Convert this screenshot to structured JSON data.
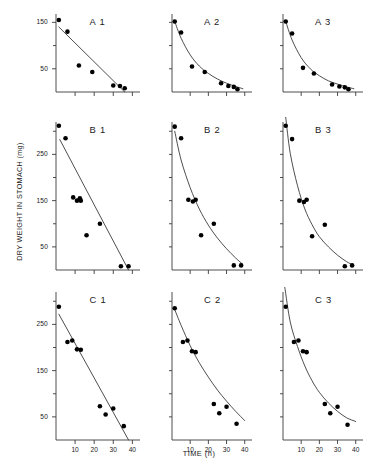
{
  "figure": {
    "ylabel": "DRY WEIGHT IN STOMACH (mg)",
    "xlabel": "TIME (h)",
    "line_color": "#3a3a3a",
    "point_color": "#000000",
    "axis_color": "#3a3a3a",
    "background": "#ffffff"
  },
  "chart_data": {
    "type": "scatter",
    "title": "",
    "xlabel": "TIME (h)",
    "ylabel": "DRY WEIGHT IN STOMACH (mg)",
    "grid": false,
    "legend": "none",
    "layout": {
      "rows": 3,
      "cols": 3
    },
    "panels": [
      {
        "label": "A 1",
        "row": 0,
        "col": 0,
        "xlim": [
          0,
          44
        ],
        "ylim": [
          0,
          168
        ],
        "yticks": [
          50,
          100,
          150
        ],
        "yticklabels": [
          "50",
          "",
          "150"
        ],
        "xticks": [
          10,
          20,
          30,
          40
        ],
        "xticklabels": [
          "",
          "",
          "",
          ""
        ],
        "fit": "linear",
        "fit_points": [
          [
            1.5,
            140
          ],
          [
            36,
            0
          ]
        ],
        "x": [
          1.5,
          6,
          12,
          19,
          30,
          33.5,
          36
        ],
        "y": [
          155,
          130,
          57,
          43,
          14,
          13,
          8
        ]
      },
      {
        "label": "A 2",
        "row": 0,
        "col": 1,
        "xlim": [
          0,
          44
        ],
        "ylim": [
          0,
          168
        ],
        "yticks": [
          50,
          100,
          150
        ],
        "yticklabels": [
          "",
          "",
          ""
        ],
        "xticks": [
          10,
          20,
          30,
          40
        ],
        "xticklabels": [
          "",
          "",
          "",
          ""
        ],
        "fit": "exponential",
        "fit_points": [
          [
            1.5,
            152
          ],
          [
            5,
            116
          ],
          [
            10,
            80
          ],
          [
            15,
            56
          ],
          [
            20,
            40
          ],
          [
            25,
            28
          ],
          [
            30,
            19
          ],
          [
            35,
            12
          ],
          [
            39,
            7
          ]
        ],
        "x": [
          1.5,
          5,
          11,
          18,
          27,
          31,
          34,
          36
        ],
        "y": [
          152,
          128,
          55,
          43,
          19,
          13,
          11,
          6
        ]
      },
      {
        "label": "A 3",
        "row": 0,
        "col": 2,
        "xlim": [
          0,
          44
        ],
        "ylim": [
          0,
          168
        ],
        "yticks": [
          50,
          100,
          150
        ],
        "yticklabels": [
          "",
          "",
          ""
        ],
        "xticks": [
          10,
          20,
          30,
          40
        ],
        "xticklabels": [
          "",
          "",
          "",
          ""
        ],
        "fit": "exponential",
        "fit_points": [
          [
            1.5,
            152
          ],
          [
            5,
            112
          ],
          [
            10,
            74
          ],
          [
            15,
            50
          ],
          [
            20,
            35
          ],
          [
            25,
            24
          ],
          [
            30,
            17
          ],
          [
            35,
            11
          ],
          [
            39,
            7
          ]
        ],
        "x": [
          1.5,
          5,
          11,
          17,
          27,
          31,
          34,
          36
        ],
        "y": [
          152,
          126,
          52,
          40,
          16,
          12,
          10,
          6
        ]
      },
      {
        "label": "B 1",
        "row": 1,
        "col": 0,
        "xlim": [
          0,
          44
        ],
        "ylim": [
          0,
          320
        ],
        "yticks": [
          50,
          100,
          150,
          200,
          250,
          300
        ],
        "yticklabels": [
          "50",
          "",
          "150",
          "",
          "250",
          ""
        ],
        "xticks": [
          10,
          20,
          30,
          40
        ],
        "xticklabels": [
          "",
          "",
          "",
          ""
        ],
        "fit": "linear",
        "fit_points": [
          [
            2,
            282
          ],
          [
            38,
            0
          ]
        ],
        "x": [
          1.5,
          5,
          9,
          11,
          12.5,
          13,
          16,
          23,
          34,
          38
        ],
        "y": [
          312,
          285,
          157,
          150,
          155,
          150,
          75,
          100,
          8,
          8
        ]
      },
      {
        "label": "B 2",
        "row": 1,
        "col": 1,
        "xlim": [
          0,
          44
        ],
        "ylim": [
          0,
          320
        ],
        "yticks": [
          50,
          100,
          150,
          200,
          250,
          300
        ],
        "yticklabels": [
          "",
          "",
          "",
          "",
          "",
          ""
        ],
        "xticks": [
          10,
          20,
          30,
          40
        ],
        "xticklabels": [
          "",
          "",
          "",
          ""
        ],
        "fit": "exponential",
        "fit_points": [
          [
            1.5,
            300
          ],
          [
            5,
            238
          ],
          [
            10,
            178
          ],
          [
            15,
            132
          ],
          [
            20,
            97
          ],
          [
            25,
            69
          ],
          [
            30,
            46
          ],
          [
            35,
            26
          ],
          [
            39,
            12
          ]
        ],
        "x": [
          1.5,
          5,
          9,
          11.5,
          13,
          16,
          23,
          34,
          38
        ],
        "y": [
          310,
          285,
          152,
          148,
          152,
          75,
          100,
          10,
          10
        ]
      },
      {
        "label": "B 3",
        "row": 1,
        "col": 2,
        "xlim": [
          0,
          44
        ],
        "ylim": [
          0,
          320
        ],
        "yticks": [
          50,
          100,
          150,
          200,
          250,
          300
        ],
        "yticklabels": [
          "",
          "",
          "",
          "",
          "",
          ""
        ],
        "xticks": [
          10,
          20,
          30,
          40
        ],
        "xticklabels": [
          "",
          "",
          "",
          ""
        ],
        "fit": "exponential",
        "fit_points": [
          [
            1.5,
            330
          ],
          [
            4,
            252
          ],
          [
            8,
            182
          ],
          [
            12,
            132
          ],
          [
            16,
            98
          ],
          [
            20,
            72
          ],
          [
            25,
            50
          ],
          [
            30,
            32
          ],
          [
            35,
            18
          ],
          [
            39,
            10
          ]
        ],
        "x": [
          1.5,
          5,
          9,
          11.5,
          13,
          16,
          23,
          34,
          38
        ],
        "y": [
          312,
          283,
          150,
          147,
          152,
          73,
          98,
          8,
          10
        ]
      },
      {
        "label": "C 1",
        "row": 2,
        "col": 0,
        "xlim": [
          0,
          44
        ],
        "ylim": [
          0,
          320
        ],
        "yticks": [
          50,
          100,
          150,
          200,
          250,
          300
        ],
        "yticklabels": [
          "50",
          "",
          "150",
          "",
          "250",
          ""
        ],
        "xticks": [
          10,
          20,
          30,
          40
        ],
        "xticklabels": [
          "10",
          "20",
          "30",
          "40"
        ],
        "fit": "linear",
        "fit_points": [
          [
            1.5,
            272
          ],
          [
            38,
            0
          ]
        ],
        "x": [
          1.5,
          6,
          8.5,
          11,
          13,
          23,
          26,
          30,
          35.5
        ],
        "y": [
          288,
          212,
          215,
          196,
          195,
          73,
          55,
          68,
          30
        ]
      },
      {
        "label": "C 2",
        "row": 2,
        "col": 1,
        "xlim": [
          0,
          44
        ],
        "ylim": [
          0,
          320
        ],
        "yticks": [
          50,
          100,
          150,
          200,
          250,
          300
        ],
        "yticklabels": [
          "",
          "",
          "",
          "",
          "",
          ""
        ],
        "xticks": [
          10,
          20,
          30,
          40
        ],
        "xticklabels": [
          "10",
          "20",
          "30",
          "40"
        ],
        "fit": "exponential",
        "fit_points": [
          [
            1.5,
            282
          ],
          [
            5,
            248
          ],
          [
            10,
            204
          ],
          [
            15,
            167
          ],
          [
            20,
            136
          ],
          [
            25,
            108
          ],
          [
            30,
            84
          ],
          [
            35,
            62
          ],
          [
            40,
            42
          ]
        ],
        "x": [
          1.5,
          6,
          8.5,
          11,
          13,
          23,
          26,
          30,
          35.5
        ],
        "y": [
          285,
          212,
          215,
          192,
          190,
          78,
          58,
          72,
          35
        ]
      },
      {
        "label": "C 3",
        "row": 2,
        "col": 2,
        "xlim": [
          0,
          44
        ],
        "ylim": [
          0,
          320
        ],
        "yticks": [
          50,
          100,
          150,
          200,
          250,
          300
        ],
        "yticklabels": [
          "",
          "",
          "",
          "",
          "",
          ""
        ],
        "xticks": [
          10,
          20,
          30,
          40
        ],
        "xticklabels": [
          "10",
          "20",
          "30",
          "40"
        ],
        "fit": "exponential",
        "fit_points": [
          [
            1,
            330
          ],
          [
            4,
            255
          ],
          [
            8,
            202
          ],
          [
            12,
            160
          ],
          [
            16,
            128
          ],
          [
            20,
            103
          ],
          [
            25,
            80
          ],
          [
            30,
            62
          ],
          [
            35,
            48
          ],
          [
            40,
            40
          ]
        ],
        "x": [
          1.5,
          6,
          8.5,
          11,
          13,
          23,
          26,
          30,
          35.5
        ],
        "y": [
          288,
          212,
          215,
          192,
          190,
          78,
          58,
          72,
          33
        ]
      }
    ]
  }
}
